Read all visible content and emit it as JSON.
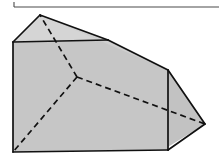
{
  "figure": {
    "canvas": {
      "width": 220,
      "height": 160
    },
    "colors": {
      "background": "#ffffff",
      "fill_front": "#c6c6c6",
      "fill_right": "#c2c2c2",
      "fill_top_band": "#cfcfcf",
      "fill_top_left": "#d5d5d5",
      "edge": "#111111",
      "frame_rule": "#4a4a4a"
    },
    "vertices": {
      "apex_top": [
        40,
        15
      ],
      "left_top": [
        13,
        42
      ],
      "left_bottom": [
        13,
        152
      ],
      "ridge_right": [
        108,
        40
      ],
      "upper_right": [
        168,
        70
      ],
      "lower_right": [
        168,
        150
      ],
      "bottom_right": [
        163,
        150
      ],
      "right_apex": [
        205,
        124
      ],
      "hidden_center": [
        77,
        77
      ]
    },
    "visible_edges": [
      {
        "name": "apex-to-left-top",
        "from": [
          40,
          15
        ],
        "to": [
          13,
          42
        ]
      },
      {
        "name": "apex-to-ridge-right",
        "from": [
          40,
          15
        ],
        "to": [
          108,
          40
        ]
      },
      {
        "name": "left-top-to-ridge-right",
        "from": [
          13,
          42
        ],
        "to": [
          108,
          40
        ]
      },
      {
        "name": "ridge-right-to-upper-right",
        "from": [
          108,
          40
        ],
        "to": [
          168,
          70
        ]
      },
      {
        "name": "left-vertical",
        "from": [
          13,
          42
        ],
        "to": [
          13,
          152
        ]
      },
      {
        "name": "bottom-edge",
        "from": [
          13,
          152
        ],
        "to": [
          168,
          150
        ]
      },
      {
        "name": "right-vertical",
        "from": [
          168,
          70
        ],
        "to": [
          168,
          150
        ]
      },
      {
        "name": "upper-right-to-right-apex",
        "from": [
          168,
          70
        ],
        "to": [
          205,
          124
        ]
      },
      {
        "name": "right-apex-to-bottom-right",
        "from": [
          205,
          124
        ],
        "to": [
          168,
          150
        ]
      }
    ],
    "hidden_edges": [
      {
        "name": "hidden-to-apex",
        "from": [
          77,
          77
        ],
        "to": [
          40,
          15
        ]
      },
      {
        "name": "hidden-to-left-bottom",
        "from": [
          77,
          77
        ],
        "to": [
          13,
          152
        ]
      },
      {
        "name": "hidden-to-right-apex",
        "from": [
          77,
          77
        ],
        "to": [
          205,
          124
        ]
      }
    ],
    "frame": {
      "name": "top-rule",
      "from": [
        14,
        7
      ],
      "to": [
        219,
        7
      ],
      "left_tick_from": [
        14,
        2
      ],
      "left_tick_to": [
        14,
        7
      ]
    }
  }
}
